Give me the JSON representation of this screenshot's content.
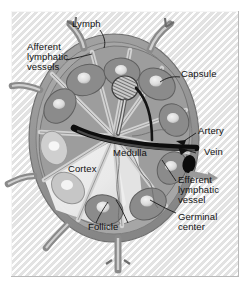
{
  "figure": {
    "type": "anatomical-diagram",
    "palette": {
      "background": "#ffffff",
      "panel": "#e9e9e9",
      "capsule_outer": "#8f8f8f",
      "capsule_inner": "#a8a8a8",
      "cortex_light": "#d9d9d9",
      "medulla_mid": "#9b9b9b",
      "follicle_fill": "#8a8a8a",
      "germinal_center": "#e4e4e4",
      "vessel_dark": "#1a1a1a",
      "label_text": "#111111"
    }
  },
  "labels": [
    {
      "id": "lymph",
      "text": "Lymph"
    },
    {
      "id": "afferent",
      "text": "Afferent\nlymphatic\nvessels"
    },
    {
      "id": "capsule",
      "text": "Capsule"
    },
    {
      "id": "artery",
      "text": "Artery"
    },
    {
      "id": "vein",
      "text": "Vein"
    },
    {
      "id": "medulla",
      "text": "Medulla"
    },
    {
      "id": "cortex",
      "text": "Cortex"
    },
    {
      "id": "efferent",
      "text": "Efferent\nlymphatic\nvessel"
    },
    {
      "id": "germinal_center",
      "text": "Germinal\ncenter"
    },
    {
      "id": "follicle",
      "text": "Follicle"
    }
  ],
  "label_text": {
    "lymph": "Lymph",
    "afferent_l1": "Afferent",
    "afferent_l2": "lymphatic",
    "afferent_l3": "vessels",
    "capsule": "Capsule",
    "artery": "Artery",
    "vein": "Vein",
    "medulla": "Medulla",
    "cortex": "Cortex",
    "efferent_l1": "Efferent",
    "efferent_l2": "lymphatic",
    "efferent_l3": "vessel",
    "germinal_l1": "Germinal",
    "germinal_l2": "center",
    "follicle": "Follicle"
  },
  "structures": {
    "afferent_vessel_count": 6,
    "follicle_count": 10,
    "germinal_center_count": 10,
    "efferent_vessel_count": 1,
    "artery_count": 1,
    "vein_count": 1
  }
}
